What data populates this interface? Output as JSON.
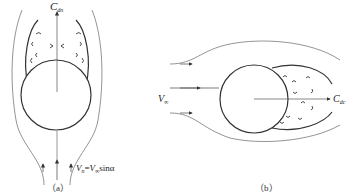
{
  "figure_a": {
    "caption": "（a）",
    "drag_label": {
      "main": "C",
      "sub": "dn"
    },
    "velocity_label": {
      "v1": "V",
      "v1_sub": "n",
      "eq": "=",
      "v2": "V",
      "v2_sub": "∞",
      "func": "sinα"
    }
  },
  "figure_b": {
    "caption": "（b）",
    "inflow_label": {
      "main": "V",
      "sub": "∞"
    },
    "drag_label": {
      "main": "C",
      "sub": "dc"
    }
  },
  "colors": {
    "stroke": "#333333",
    "thin_stroke": "#555555",
    "background": "#ffffff"
  }
}
